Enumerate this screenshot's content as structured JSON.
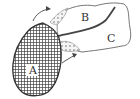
{
  "diagram": {
    "type": "anatomical-sketch",
    "regions": [
      {
        "id": "A",
        "label": "A",
        "fill": "crosshatch"
      },
      {
        "id": "B",
        "label": "B",
        "fill": "none"
      },
      {
        "id": "C",
        "label": "C",
        "fill": "none"
      }
    ],
    "dotted_regions": 2,
    "arrows": 2,
    "colors": {
      "stroke": "#555555",
      "hatch": "#444444",
      "background": "#ffffff"
    }
  }
}
